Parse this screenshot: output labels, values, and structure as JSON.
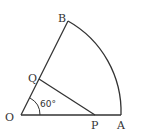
{
  "diagram": {
    "type": "sector",
    "points": {
      "O": {
        "label": "O"
      },
      "A": {
        "label": "A"
      },
      "B": {
        "label": "B"
      },
      "P": {
        "label": "P"
      },
      "Q": {
        "label": "Q"
      }
    },
    "angle_label": "60°",
    "stroke_color": "#333333"
  }
}
